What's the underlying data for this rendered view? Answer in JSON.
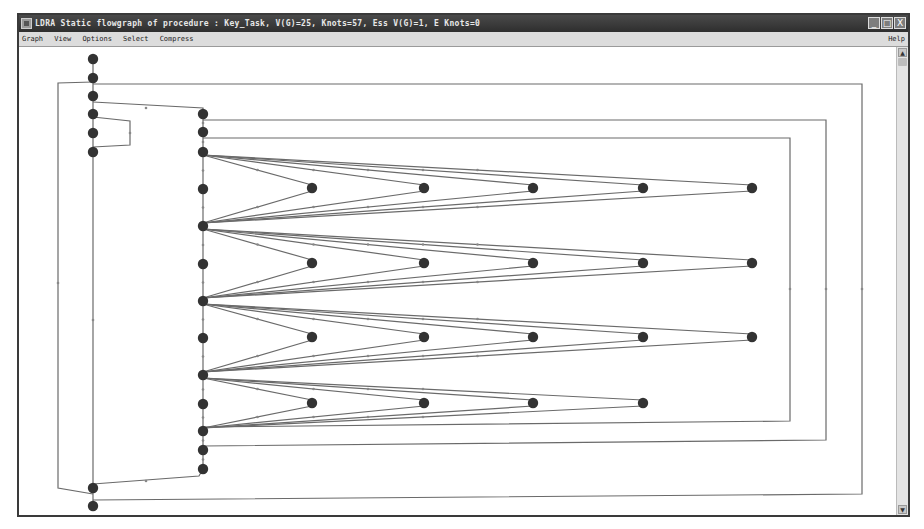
{
  "window": {
    "title": "LDRA Static flowgraph of procedure : Key_Task, V(G)=25, Knots=57, Ess V(G)=1, E Knots=0",
    "controls": {
      "minimize": "_",
      "maximize": "□",
      "close": "X"
    }
  },
  "menu": {
    "items": [
      "Graph",
      "View",
      "Options",
      "Select",
      "Compress"
    ],
    "help": "Help"
  },
  "scrollbar": {
    "up": "▲",
    "down": "▼"
  },
  "graph": {
    "procedure": "Key_Task",
    "metrics": {
      "cyclomatic_complexity": 25,
      "knots": 57,
      "essential_complexity": 1,
      "essential_knots": 0
    },
    "node_color": "#333333",
    "edge_color": "#6a6a6a",
    "columns": {
      "main": [
        "m0",
        "m1",
        "m2",
        "m3",
        "m4",
        "m5",
        "m6",
        "m7"
      ],
      "body": [
        "b0",
        "b1",
        "b2",
        "b3",
        "b4",
        "b5",
        "b6",
        "b7",
        "b8",
        "b9",
        "b10",
        "b11",
        "b12"
      ],
      "fan_levels": [
        {
          "source": "b2",
          "targets": [
            "f0a",
            "f0b",
            "f0c",
            "f0d",
            "f0e"
          ],
          "sink": "b4"
        },
        {
          "source": "b4",
          "targets": [
            "f1a",
            "f1b",
            "f1c",
            "f1d",
            "f1e"
          ],
          "sink": "b6"
        },
        {
          "source": "b6",
          "targets": [
            "f2a",
            "f2b",
            "f2c",
            "f2d",
            "f2e"
          ],
          "sink": "b8"
        },
        {
          "source": "b8",
          "targets": [
            "f3a",
            "f3b",
            "f3c",
            "f3d"
          ],
          "sink": "b10"
        }
      ]
    },
    "edges": [
      [
        "m0",
        "m1"
      ],
      [
        "m1",
        "m2"
      ],
      [
        "m2",
        "m3"
      ],
      [
        "m3",
        "m4"
      ],
      [
        "m4",
        "m5"
      ],
      [
        "m3",
        "m5"
      ],
      [
        "m5",
        "m6"
      ],
      [
        "m6",
        "m7"
      ],
      [
        "m1",
        "m6"
      ],
      [
        "m2",
        "b0"
      ],
      [
        "b0",
        "b1"
      ],
      [
        "b1",
        "b2"
      ],
      [
        "b2",
        "b3"
      ],
      [
        "b3",
        "b4"
      ],
      [
        "b4",
        "b5"
      ],
      [
        "b5",
        "b6"
      ],
      [
        "b6",
        "b7"
      ],
      [
        "b7",
        "b8"
      ],
      [
        "b8",
        "b9"
      ],
      [
        "b9",
        "b10"
      ],
      [
        "b10",
        "b11"
      ],
      [
        "b11",
        "b12"
      ],
      [
        "b12",
        "m6"
      ]
    ],
    "back_loops": [
      {
        "from": "m1",
        "to": "m7",
        "level": 3
      },
      {
        "from": "b0",
        "to": "b11",
        "level": 2
      },
      {
        "from": "b1",
        "to": "b10",
        "level": 1
      }
    ]
  }
}
